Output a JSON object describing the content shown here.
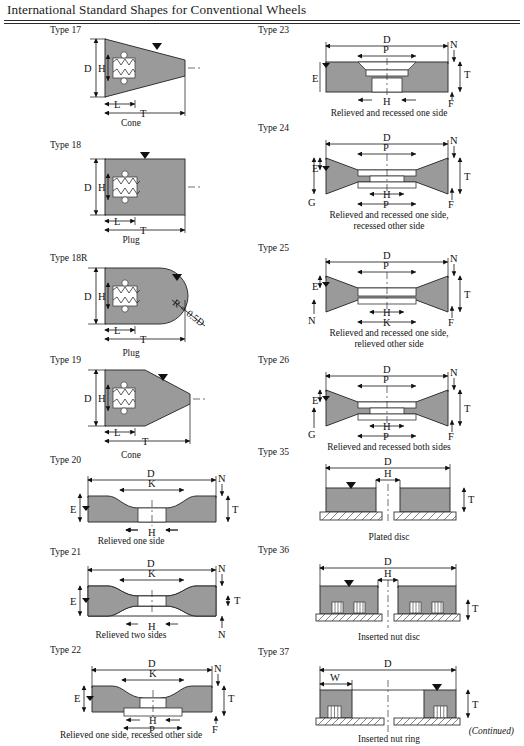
{
  "page": {
    "title": "International Standard Shapes for Conventional Wheels",
    "footer": "(Continued)"
  },
  "dim": {
    "D": "D",
    "H": "H",
    "T": "T",
    "L": "L",
    "K": "K",
    "N": "N",
    "E": "E",
    "F": "F",
    "G": "G",
    "P": "P",
    "W": "W",
    "R": "R = 0.5D"
  },
  "figures": [
    {
      "id": "type-17",
      "type_label": "Type 17",
      "caption": "Cone",
      "shape": "cone",
      "dims": [
        "D",
        "H",
        "L",
        "T"
      ]
    },
    {
      "id": "type-18",
      "type_label": "Type 18",
      "caption": "Plug",
      "shape": "plug",
      "dims": [
        "D",
        "H",
        "L",
        "T"
      ]
    },
    {
      "id": "type-18r",
      "type_label": "Type 18R",
      "caption": "Plug",
      "shape": "plug-radius",
      "dims": [
        "D",
        "H",
        "L",
        "T",
        "R = 0.5D"
      ]
    },
    {
      "id": "type-19",
      "type_label": "Type 19",
      "caption": "Cone",
      "shape": "cone-long",
      "dims": [
        "D",
        "H",
        "L",
        "T"
      ]
    },
    {
      "id": "type-20",
      "type_label": "Type 20",
      "caption": "Relieved one side",
      "shape": "relieved-one-side",
      "dims": [
        "D",
        "K",
        "H",
        "N",
        "E",
        "T"
      ]
    },
    {
      "id": "type-21",
      "type_label": "Type 21",
      "caption": "Relieved two sides",
      "shape": "relieved-two-sides",
      "dims": [
        "D",
        "K",
        "H",
        "N",
        "E",
        "T",
        "N"
      ]
    },
    {
      "id": "type-22",
      "type_label": "Type 22",
      "caption": "Relieved one side, recessed other side",
      "shape": "relieved-recessed",
      "dims": [
        "D",
        "K",
        "H",
        "P",
        "N",
        "E",
        "T",
        "F"
      ]
    },
    {
      "id": "type-23",
      "type_label": "Type 23",
      "caption": "Relieved and recessed one side",
      "shape": "recessed-one-side",
      "dims": [
        "D",
        "P",
        "H",
        "N",
        "E",
        "T",
        "F"
      ]
    },
    {
      "id": "type-24",
      "type_label": "Type 24",
      "caption": "Relieved and recessed one side,\nrecessed other side",
      "caption_line1": "Relieved and recessed one side,",
      "caption_line2": "recessed other side",
      "shape": "hourglass-recessed",
      "dims": [
        "D",
        "P",
        "H",
        "P",
        "N",
        "E",
        "G",
        "T",
        "F"
      ]
    },
    {
      "id": "type-25",
      "type_label": "Type 25",
      "caption_line1": "Relieved and recessed one side,",
      "caption_line2": "relieved other side",
      "shape": "hourglass-relieved",
      "dims": [
        "D",
        "P",
        "H",
        "K",
        "N",
        "E",
        "N",
        "T",
        "F"
      ]
    },
    {
      "id": "type-26",
      "type_label": "Type 26",
      "caption": "Relieved and recessed both sides",
      "shape": "hourglass-both",
      "dims": [
        "D",
        "P",
        "H",
        "P",
        "N",
        "E",
        "G",
        "T",
        "F"
      ]
    },
    {
      "id": "type-35",
      "type_label": "Type 35",
      "caption": "Plated disc",
      "shape": "plated-disc",
      "dims": [
        "D",
        "H",
        "T"
      ]
    },
    {
      "id": "type-36",
      "type_label": "Type 36",
      "caption": "Inserted nut disc",
      "shape": "inserted-nut-disc",
      "dims": [
        "D",
        "H",
        "T"
      ]
    },
    {
      "id": "type-37",
      "type_label": "Type 37",
      "caption": "Inserted nut ring",
      "shape": "inserted-nut-ring",
      "dims": [
        "D",
        "W",
        "T"
      ]
    }
  ]
}
